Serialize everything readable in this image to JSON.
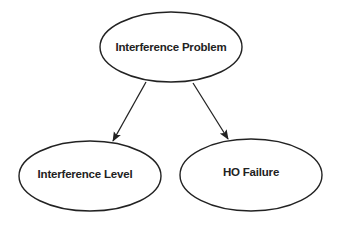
{
  "diagram": {
    "type": "directed-graph",
    "colors": {
      "background": "#ffffff",
      "stroke": "#222222",
      "text": "#222222"
    },
    "nodes": [
      {
        "id": "interference-problem",
        "label": "Interference Problem",
        "shape": "ellipse",
        "cx": 171,
        "cy": 47,
        "rx": 71,
        "ry": 35
      },
      {
        "id": "interference-level",
        "label": "Interference Level",
        "shape": "ellipse",
        "cx": 90,
        "cy": 176,
        "rx": 71,
        "ry": 35
      },
      {
        "id": "ho-failure",
        "label": "HO Failure",
        "shape": "ellipse",
        "cx": 251,
        "cy": 175,
        "rx": 71,
        "ry": 36
      }
    ],
    "edges": [
      {
        "from": "interference-problem",
        "to": "interference-level",
        "directed": true
      },
      {
        "from": "interference-problem",
        "to": "ho-failure",
        "directed": true
      }
    ]
  }
}
